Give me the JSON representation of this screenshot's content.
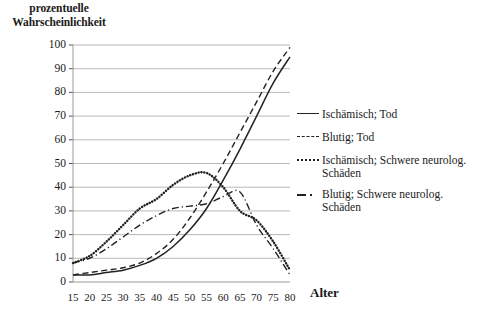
{
  "chart_data": {
    "type": "line",
    "title": "",
    "ylabel": "prozentuelle Wahrscheinlichkeit",
    "ylabel_line1": "prozentuelle",
    "ylabel_line2": "Wahrscheinlichkeit",
    "xlabel": "Alter",
    "grid": true,
    "legend_position": "right",
    "xlim": [
      15,
      80
    ],
    "ylim": [
      0,
      100
    ],
    "categories": [
      15,
      20,
      25,
      30,
      35,
      40,
      45,
      50,
      55,
      60,
      65,
      70,
      75,
      80
    ],
    "xticks": [
      "15",
      "20",
      "25",
      "30",
      "35",
      "40",
      "45",
      "50",
      "55",
      "60",
      "65",
      "70",
      "75",
      "80"
    ],
    "yticks": [
      "0",
      "10",
      "20",
      "30",
      "40",
      "50",
      "60",
      "70",
      "80",
      "90",
      "100"
    ],
    "series": [
      {
        "name": "Ischämisch; Tod",
        "style": "solid",
        "color": "#222222",
        "values": [
          3,
          3,
          4,
          5,
          7,
          10,
          15,
          22,
          31,
          43,
          56,
          70,
          84,
          95
        ]
      },
      {
        "name": "Blutig; Tod",
        "style": "dashed",
        "color": "#222222",
        "values": [
          3,
          4,
          5,
          6,
          8,
          12,
          18,
          27,
          38,
          50,
          63,
          76,
          89,
          99
        ]
      },
      {
        "name": "Ischämisch; Schwere neurolog. Schäden",
        "style": "dotted",
        "color": "#222222",
        "values": [
          8,
          11,
          17,
          24,
          31,
          35,
          41,
          45,
          46,
          40,
          30,
          26,
          17,
          5
        ]
      },
      {
        "name": "Blutig; Schwere neurolog. Schäden",
        "style": "dashdot",
        "color": "#222222",
        "values": [
          8,
          10,
          14,
          19,
          24,
          28,
          31,
          32,
          33,
          36,
          38,
          24,
          14,
          3
        ]
      }
    ]
  },
  "legend": {
    "items": [
      {
        "label": "Ischämisch; Tod",
        "style": "solid"
      },
      {
        "label": "Blutig; Tod",
        "style": "dashed"
      },
      {
        "label": "Ischämisch; Schwere neurolog. Schäden",
        "style": "dotted"
      },
      {
        "label": "Blutig; Schwere neurolog. Schäden",
        "style": "dashdot"
      }
    ]
  }
}
